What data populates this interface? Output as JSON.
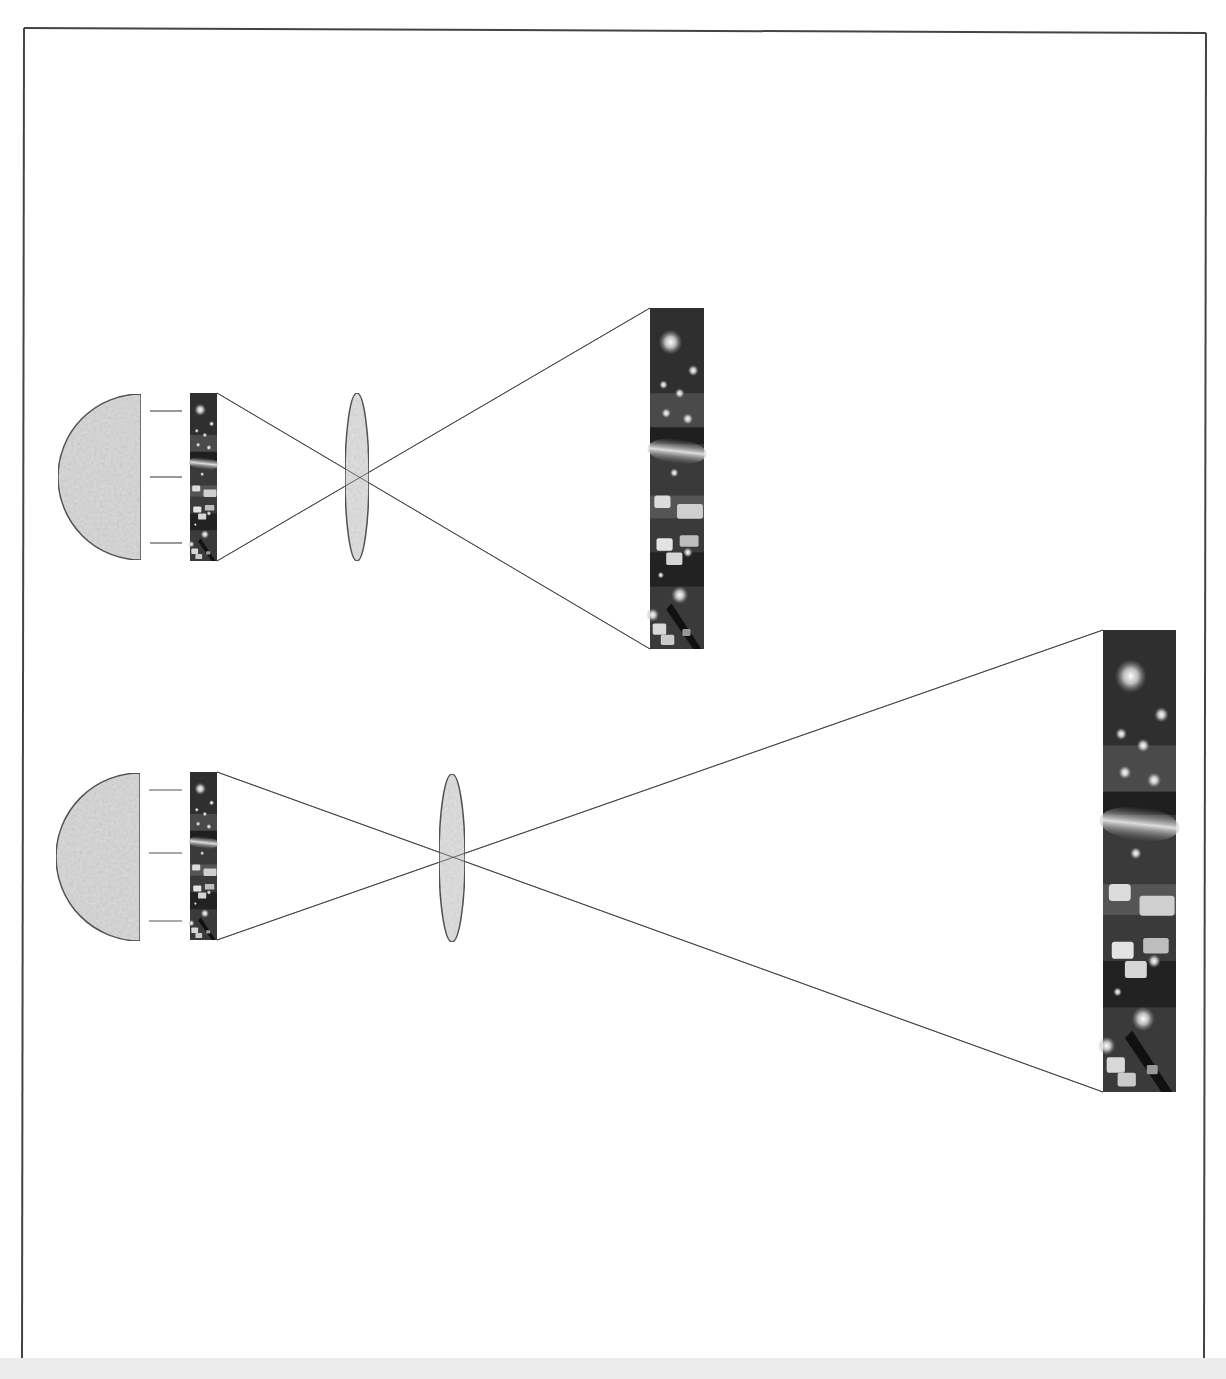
{
  "figure": {
    "frame": {
      "x": 24,
      "y": 28,
      "w": 1182,
      "h": 1340,
      "stroke": "#444444"
    },
    "colors": {
      "fill_gray": "#dadada",
      "outline": "#555555",
      "ray": "#444444",
      "image_dark": "#2e2e2e"
    },
    "assemblies": [
      {
        "name": "upper-projection",
        "light_source": {
          "cx": 141,
          "cy": 477,
          "r": 83
        },
        "light_marks_y": [
          411,
          477,
          543
        ],
        "slide": {
          "x": 190,
          "y": 393,
          "w": 27,
          "h": 168
        },
        "lens": {
          "cx": 357,
          "cy": 477,
          "rx": 12,
          "ry": 84
        },
        "image": {
          "x": 650,
          "y": 308,
          "w": 54,
          "h": 341
        }
      },
      {
        "name": "lower-projection",
        "light_source": {
          "cx": 140,
          "cy": 857,
          "r": 84
        },
        "light_marks_y": [
          790,
          853,
          921
        ],
        "slide": {
          "x": 190,
          "y": 772,
          "w": 27,
          "h": 168
        },
        "lens": {
          "cx": 452,
          "cy": 858,
          "rx": 13,
          "ry": 84
        },
        "image": {
          "x": 1103,
          "y": 630,
          "w": 73,
          "h": 462
        }
      }
    ]
  }
}
